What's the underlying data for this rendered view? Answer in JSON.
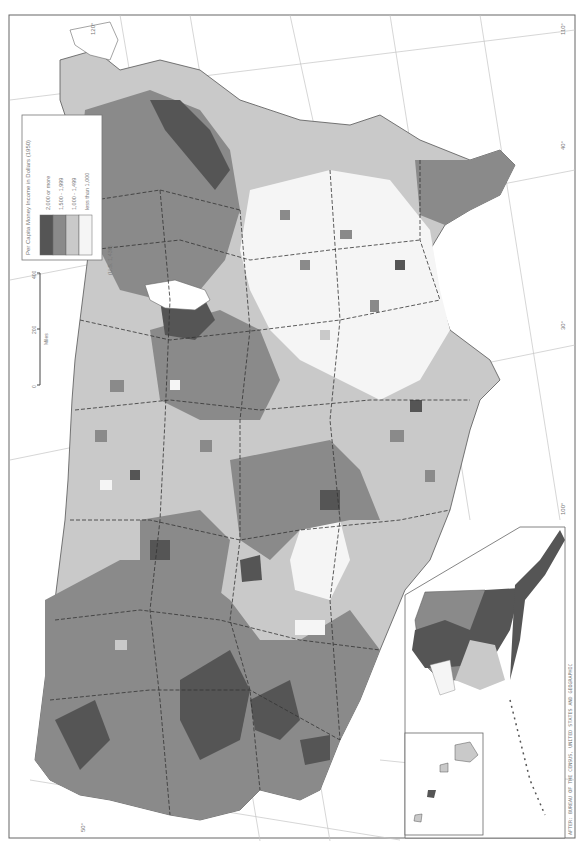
{
  "map": {
    "title": "Per Capita Money Income in Dollars (1950)",
    "national_average": "(U.S. 1,436)",
    "legend": {
      "title": "Per Capita Money Income in Dollars (1950)",
      "classes": [
        {
          "label": "2,000 or more",
          "color": "#555555"
        },
        {
          "label": "1,500 - 1,999",
          "color": "#8a8a8a"
        },
        {
          "label": "1,000 - 1,499",
          "color": "#c9c9c9"
        },
        {
          "label": "less than 1,000",
          "color": "#f5f5f5"
        }
      ]
    },
    "scale_bar": {
      "ticks": [
        "0",
        "200",
        "400"
      ],
      "unit": "Miles"
    },
    "graticule_labels": [
      "30°",
      "100°",
      "40°",
      "110°",
      "120°",
      "50°",
      "150°",
      "170°",
      "20°"
    ],
    "credit": "AFTER: BUREAU OF THE CENSUS, UNITED STATES AND GEOGRAPHIC"
  },
  "colors": {
    "c2000": "#555555",
    "c1500": "#8a8a8a",
    "c1000": "#c9c9c9",
    "c0": "#f5f5f5",
    "outline": "#444444",
    "graticule": "#bbbbbb",
    "frame": "#666666"
  }
}
